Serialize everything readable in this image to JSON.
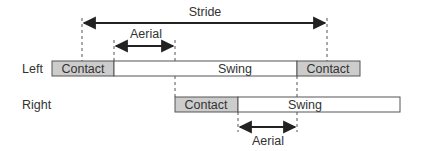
{
  "diagram": {
    "stride_label": "Stride",
    "aerial_top_label": "Aerial",
    "aerial_bottom_label": "Aerial",
    "rows": [
      {
        "label": "Left",
        "segments": [
          {
            "label": "Contact",
            "type": "contact"
          },
          {
            "label": "Swing",
            "type": "swing"
          },
          {
            "label": "Contact",
            "type": "contact"
          }
        ]
      },
      {
        "label": "Right",
        "segments": [
          {
            "label": "Contact",
            "type": "contact"
          },
          {
            "label": "Swing",
            "type": "swing"
          }
        ]
      }
    ],
    "colors": {
      "contact_fill": "#cccccc",
      "swing_fill": "#ffffff",
      "stroke": "#555555",
      "arrow": "#222222"
    }
  }
}
